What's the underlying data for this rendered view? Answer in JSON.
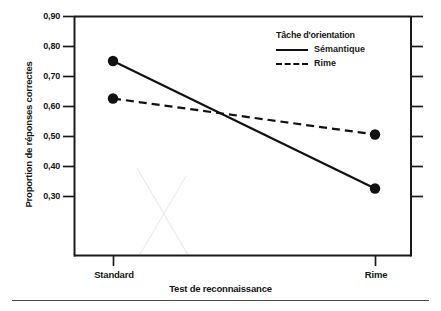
{
  "chart_data": {
    "type": "line",
    "title": "",
    "xlabel": "Test de reconnaissance",
    "ylabel": "Proportion de réponses correctes",
    "categories": [
      "Standard",
      "Rime"
    ],
    "series": [
      {
        "name": "Sémantique",
        "values": [
          0.75,
          0.325
        ],
        "style": "solid"
      },
      {
        "name": "Rime",
        "values": [
          0.625,
          0.505
        ],
        "style": "dashed"
      }
    ],
    "yticks": [
      "0,90",
      "0,80",
      "0,70",
      "0,60",
      "0,50",
      "0,40",
      "0,30"
    ],
    "ytick_values": [
      0.9,
      0.8,
      0.7,
      0.6,
      0.5,
      0.4,
      0.3
    ],
    "ylim": [
      0.1,
      0.9
    ],
    "grid": false,
    "legend": {
      "title": "Tâche d'orientation",
      "position": "top-right",
      "entries": [
        {
          "label": "Sémantique",
          "style": "solid"
        },
        {
          "label": "Rime",
          "style": "dashed"
        }
      ]
    },
    "marker": "filled-circle",
    "line_color": "#111111"
  },
  "axes": {
    "y_labels": [
      "0,90",
      "0,80",
      "0,70",
      "0,60",
      "0,50",
      "0,40",
      "0,30"
    ],
    "x_labels": [
      "Standard",
      "Rime"
    ],
    "y_title": "Proportion de réponses correctes",
    "x_title": "Test de reconnaissance"
  },
  "legend": {
    "title": "Tâche d'orientation",
    "entry_semantique": "Sémantique",
    "entry_rime": "Rime"
  }
}
